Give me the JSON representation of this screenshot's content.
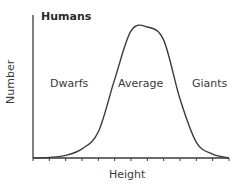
{
  "chart_data": {
    "type": "line",
    "title": "Humans",
    "xlabel": "Height",
    "ylabel": "Number",
    "annotations": [
      {
        "text": "Dwarfs",
        "x": 2.0
      },
      {
        "text": "Average",
        "x": 6.0
      },
      {
        "text": "Giants",
        "x": 10.0
      }
    ],
    "x": [
      0,
      1,
      2,
      3,
      4,
      5,
      6,
      7,
      8,
      9,
      10,
      11,
      12
    ],
    "series": [
      {
        "name": "Humans",
        "values": [
          0,
          0.5,
          2,
          7,
          20,
          60,
          97,
          100,
          90,
          45,
          12,
          3,
          0
        ]
      }
    ],
    "x_ticks": 13,
    "ylim": [
      0,
      100
    ],
    "grid": false,
    "legend": "none",
    "tick_labels": false,
    "colors": {
      "line": "#3a3a3a",
      "axis": "#3a3a3a"
    }
  }
}
